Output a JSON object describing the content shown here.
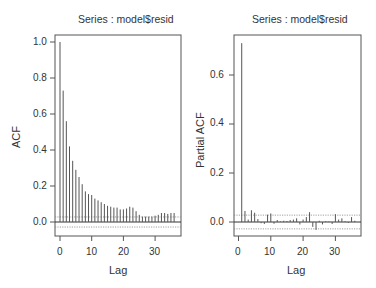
{
  "chart_data": [
    {
      "type": "bar",
      "subtype": "acf-lollipop",
      "title": "Series : model$resid",
      "xlabel": "Lag",
      "ylabel": "ACF",
      "xlim": [
        0,
        36
      ],
      "ylim": [
        -0.07,
        1.03
      ],
      "xticks": [
        0,
        10,
        20,
        30
      ],
      "yticks": [
        0.0,
        0.2,
        0.4,
        0.6,
        0.8,
        1.0
      ],
      "ytick_labels": [
        "0.0",
        "0.2",
        "0.4",
        "0.6",
        "0.8",
        "1.0"
      ],
      "confidence_band": [
        -0.028,
        0.028
      ],
      "x": [
        0,
        1,
        2,
        3,
        4,
        5,
        6,
        7,
        8,
        9,
        10,
        11,
        12,
        13,
        14,
        15,
        16,
        17,
        18,
        19,
        20,
        21,
        22,
        23,
        24,
        25,
        26,
        27,
        28,
        29,
        30,
        31,
        32,
        33,
        34,
        35,
        36
      ],
      "values": [
        1.0,
        0.73,
        0.56,
        0.42,
        0.34,
        0.29,
        0.25,
        0.21,
        0.17,
        0.155,
        0.15,
        0.13,
        0.12,
        0.11,
        0.1,
        0.09,
        0.085,
        0.08,
        0.08,
        0.07,
        0.07,
        0.075,
        0.085,
        0.08,
        0.06,
        0.04,
        0.03,
        0.03,
        0.03,
        0.03,
        0.035,
        0.04,
        0.05,
        0.05,
        0.045,
        0.05,
        0.05
      ]
    },
    {
      "type": "bar",
      "subtype": "pacf-lollipop",
      "title": "Series : model$resid",
      "xlabel": "Lag",
      "ylabel": "Partial ACF",
      "xlim": [
        1,
        36
      ],
      "ylim": [
        -0.06,
        0.77
      ],
      "xticks": [
        0,
        10,
        20,
        30
      ],
      "yticks": [
        0.0,
        0.2,
        0.4,
        0.6
      ],
      "ytick_labels": [
        "0.0",
        "0.2",
        "0.4",
        "0.6"
      ],
      "confidence_band": [
        -0.028,
        0.028
      ],
      "x": [
        1,
        2,
        3,
        4,
        5,
        6,
        7,
        8,
        9,
        10,
        11,
        12,
        13,
        14,
        15,
        16,
        17,
        18,
        19,
        20,
        21,
        22,
        23,
        24,
        25,
        26,
        27,
        28,
        29,
        30,
        31,
        32,
        33,
        34,
        35,
        36
      ],
      "values": [
        0.73,
        0.045,
        0.01,
        0.048,
        0.038,
        0.012,
        -0.005,
        -0.008,
        0.03,
        0.035,
        -0.007,
        0.008,
        0.002,
        0.005,
        0.004,
        0.008,
        0.01,
        0.015,
        -0.01,
        0.01,
        0.02,
        0.04,
        -0.02,
        -0.032,
        0.005,
        -0.01,
        0.003,
        0.002,
        -0.008,
        0.032,
        0.01,
        0.015,
        0.003,
        -0.004,
        0.02,
        0.005
      ]
    }
  ],
  "panels": {
    "left": {
      "title": "Series : model$resid",
      "ylabel": "ACF",
      "xlabel": "Lag",
      "yticks": [
        "1.0",
        "0.8",
        "0.6",
        "0.4",
        "0.2",
        "0.0"
      ],
      "xticks": [
        "0",
        "10",
        "20",
        "30"
      ]
    },
    "right": {
      "title": "Series : model$resid",
      "ylabel": "Partial ACF",
      "xlabel": "Lag",
      "yticks": [
        "0.6",
        "0.4",
        "0.2",
        "0.0"
      ],
      "xticks": [
        "0",
        "10",
        "20",
        "30"
      ]
    }
  },
  "colors": {
    "bars": "#555555",
    "frame": "#555555",
    "confidence": "#888888",
    "zero_line": "#333333"
  }
}
